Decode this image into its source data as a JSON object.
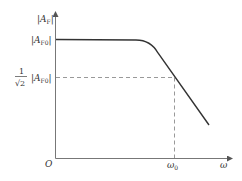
{
  "diagram": {
    "type": "frequency-response",
    "y_axis_label": "|A",
    "y_axis_label_sub": "F",
    "passband_label": "|A",
    "passband_label_sub": "F0",
    "cutoff_fraction_num": "1",
    "cutoff_fraction_den": "√2",
    "cutoff_label": "|A",
    "cutoff_label_sub": "F0",
    "origin_label": "O",
    "cutoff_freq_label": "ω",
    "cutoff_freq_sub": "0",
    "x_axis_label": "ω",
    "colors": {
      "curve": "#333333",
      "axis": "#555555",
      "dashed": "#888888"
    }
  }
}
